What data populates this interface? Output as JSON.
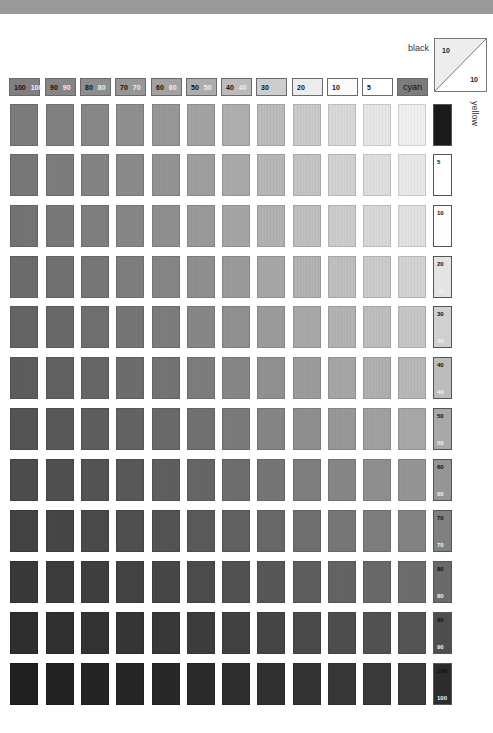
{
  "labels": {
    "black": "black",
    "yellow": "yellow",
    "corner_top": "10",
    "corner_bottom": "10"
  },
  "header": [
    {
      "k": "100",
      "w": "100",
      "color": "#808080"
    },
    {
      "k": "90",
      "w": "90",
      "color": "#868686"
    },
    {
      "k": "80",
      "w": "80",
      "color": "#8e8e8e"
    },
    {
      "k": "70",
      "w": "70",
      "color": "#979797"
    },
    {
      "k": "60",
      "w": "60",
      "color": "#a2a2a2"
    },
    {
      "k": "50",
      "w": "50",
      "color": "#adadad"
    },
    {
      "k": "40",
      "w": "40",
      "color": "#bbbbbb"
    },
    {
      "k": "30",
      "w": "",
      "color": "#cdcdcd"
    },
    {
      "k": "20",
      "w": "",
      "color": "#ececec"
    },
    {
      "k": "10",
      "w": "",
      "color": "#fafafa"
    },
    {
      "k": "5",
      "w": "",
      "color": "#ffffff"
    },
    {
      "k": "cyan",
      "w": "",
      "color": "#7c7c7c",
      "is_label": true
    }
  ],
  "rows": [
    {
      "key_top": "",
      "key_bottom": "",
      "key_color": "#1a1a1a",
      "shades": [
        "#7c7c7c",
        "#818181",
        "#888888",
        "#8f8f8f",
        "#989898",
        "#a3a3a3",
        "#afafaf",
        "#bcbcbc",
        "#cacaca",
        "#d9d9d9",
        "#e6e6e6",
        "#efefef"
      ]
    },
    {
      "key_top": "5",
      "key_bottom": "",
      "key_color": "#ffffff",
      "shades": [
        "#787878",
        "#7d7d7d",
        "#848484",
        "#8b8b8b",
        "#949494",
        "#9f9f9f",
        "#aaaaaa",
        "#b7b7b7",
        "#c4c4c4",
        "#d2d2d2",
        "#dfdfdf",
        "#e8e8e8"
      ]
    },
    {
      "key_top": "10",
      "key_bottom": "",
      "key_color": "#fdfdfd",
      "shades": [
        "#747474",
        "#797979",
        "#7f7f7f",
        "#878787",
        "#8f8f8f",
        "#9a9a9a",
        "#a5a5a5",
        "#b2b2b2",
        "#bfbfbf",
        "#cccccc",
        "#d8d8d8",
        "#e1e1e1"
      ]
    },
    {
      "key_top": "20",
      "key_bottom": "20",
      "key_color": "#e3e3e3",
      "shades": [
        "#6c6c6c",
        "#717171",
        "#777777",
        "#7e7e7e",
        "#868686",
        "#909090",
        "#9b9b9b",
        "#a7a7a7",
        "#b3b3b3",
        "#bfbfbf",
        "#cbcbcb",
        "#d3d3d3"
      ]
    },
    {
      "key_top": "30",
      "key_bottom": "30",
      "key_color": "#d0d0d0",
      "shades": [
        "#656565",
        "#696969",
        "#6f6f6f",
        "#767676",
        "#7d7d7d",
        "#878787",
        "#919191",
        "#9c9c9c",
        "#a8a8a8",
        "#b3b3b3",
        "#bebebe",
        "#c6c6c6"
      ]
    },
    {
      "key_top": "40",
      "key_bottom": "40",
      "key_color": "#bcbcbc",
      "shades": [
        "#5d5d5d",
        "#616161",
        "#676767",
        "#6d6d6d",
        "#747474",
        "#7d7d7d",
        "#878787",
        "#919191",
        "#9c9c9c",
        "#a6a6a6",
        "#b0b0b0",
        "#b8b8b8"
      ]
    },
    {
      "key_top": "50",
      "key_bottom": "50",
      "key_color": "#a9a9a9",
      "shades": [
        "#555555",
        "#595959",
        "#5e5e5e",
        "#646464",
        "#6a6a6a",
        "#727272",
        "#7b7b7b",
        "#858585",
        "#8f8f8f",
        "#989898",
        "#a1a1a1",
        "#a8a8a8"
      ]
    },
    {
      "key_top": "60",
      "key_bottom": "60",
      "key_color": "#959595",
      "shades": [
        "#4c4c4c",
        "#505050",
        "#545454",
        "#595959",
        "#5f5f5f",
        "#666666",
        "#6e6e6e",
        "#767676",
        "#7f7f7f",
        "#878787",
        "#8f8f8f",
        "#959595"
      ]
    },
    {
      "key_top": "70",
      "key_bottom": "70",
      "key_color": "#808080",
      "shades": [
        "#434343",
        "#464646",
        "#4a4a4a",
        "#4f4f4f",
        "#545454",
        "#5a5a5a",
        "#616161",
        "#686868",
        "#707070",
        "#777777",
        "#7e7e7e",
        "#838383"
      ]
    },
    {
      "key_top": "80",
      "key_bottom": "80",
      "key_color": "#6a6a6a",
      "shades": [
        "#393939",
        "#3c3c3c",
        "#3f3f3f",
        "#434343",
        "#474747",
        "#4c4c4c",
        "#525252",
        "#585858",
        "#5e5e5e",
        "#646464",
        "#696969",
        "#6d6d6d"
      ]
    },
    {
      "key_top": "90",
      "key_bottom": "90",
      "key_color": "#4e4e4e",
      "shades": [
        "#2e2e2e",
        "#303030",
        "#333333",
        "#363636",
        "#393939",
        "#3d3d3d",
        "#414141",
        "#464646",
        "#4a4a4a",
        "#4e4e4e",
        "#525252",
        "#555555"
      ]
    },
    {
      "key_top": "100",
      "key_bottom": "100",
      "key_color": "#2c2c2c",
      "shades": [
        "#202020",
        "#222222",
        "#242424",
        "#262626",
        "#282828",
        "#2b2b2b",
        "#2e2e2e",
        "#313131",
        "#343434",
        "#373737",
        "#3a3a3a",
        "#3c3c3c"
      ]
    }
  ]
}
